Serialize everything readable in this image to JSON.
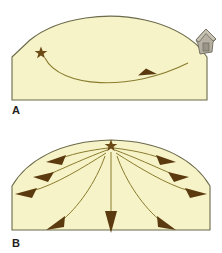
{
  "figure": {
    "type": "geologic-cross-section-diagram",
    "background_color": "#ffffff",
    "panels": [
      {
        "id": "A",
        "label": "A",
        "label_position": {
          "x": 12,
          "y": 112
        },
        "shape": "asymmetric-dome-cross-section",
        "body_fill": "#f7f3c8",
        "body_stroke": "#6b6a4a",
        "vent": {
          "icon": "star-icon",
          "label": "vent",
          "color": "#6b4a16",
          "x": 41,
          "y": 53,
          "size": 11
        },
        "flow_paths": [
          {
            "name": "single-lateral-flow",
            "from_x": 44,
            "from_y": 57,
            "to_x": 185,
            "to_y": 63,
            "sag_y": 90,
            "arrowheads": 1,
            "color": "#8a7c2e"
          }
        ],
        "structures": [
          {
            "icon": "house-icon",
            "label": "building",
            "x": 196,
            "y": 30,
            "width": 22,
            "height": 26,
            "fill": "#b5b0a2",
            "stroke": "#6b6a5a"
          }
        ]
      },
      {
        "id": "B",
        "label": "B",
        "label_position": {
          "x": 12,
          "y": 245
        },
        "shape": "symmetric-dome-cross-section",
        "body_fill": "#f7f3c8",
        "body_stroke": "#6b6a4a",
        "vent": {
          "icon": "star-icon",
          "label": "vent",
          "color": "#6b4a16",
          "x": 111,
          "y": 145,
          "size": 11
        },
        "flow_paths_count": 9,
        "flow_direction": "radial-outward-from-summit",
        "arrow_color": "#5a3a0e",
        "curve_color": "#8a7c2e"
      }
    ],
    "colors": {
      "rock_fill": "#f7f3c8",
      "outline": "#6b6a4a",
      "vent_star": "#6b4a16",
      "flow_curve": "#8a7c2e",
      "arrowhead": "#5a3a0e",
      "building_fill": "#b5b0a2",
      "building_stroke": "#6b6a5a",
      "label_text": "#231f20"
    }
  }
}
